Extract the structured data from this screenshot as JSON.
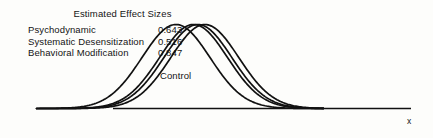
{
  "figure": {
    "background_color": "#fdfdfb",
    "ink_color": "#111111"
  },
  "legend": {
    "title": "Estimated Effect Sizes",
    "rows": [
      {
        "label": "Psychodynamic",
        "value": "0.643"
      },
      {
        "label": "Systematic Desensitization",
        "value": "0.516"
      },
      {
        "label": "Behavioral Modification",
        "value": "0.847"
      }
    ]
  },
  "annotations": {
    "control_label": "Control"
  },
  "axis": {
    "x_label": "x"
  },
  "chart_data": {
    "type": "line",
    "title": "Estimated Effect Sizes",
    "xlabel": "x",
    "ylabel": "",
    "grid": false,
    "legend_position": "top-left",
    "x": [
      -4.0,
      -3.5,
      -3.0,
      -2.5,
      -2.0,
      -1.5,
      -1.0,
      -0.5,
      0.0,
      0.5,
      1.0,
      1.5,
      2.0,
      2.5,
      3.0,
      3.5,
      4.0
    ],
    "xlim": [
      -4.0,
      4.6
    ],
    "ylim": [
      0,
      0.42
    ],
    "series": [
      {
        "name": "Control",
        "effect_size": 0.0,
        "mean": 0.0,
        "sd": 1.0,
        "values": [
          0.0001,
          0.0009,
          0.0044,
          0.0175,
          0.054,
          0.1295,
          0.242,
          0.3521,
          0.3989,
          0.3521,
          0.242,
          0.1295,
          0.054,
          0.0175,
          0.0044,
          0.0009,
          0.0001
        ]
      },
      {
        "name": "Systematic Desensitization",
        "effect_size": 0.516,
        "mean": 0.516,
        "sd": 1.0,
        "values": [
          0.0,
          0.0002,
          0.0012,
          0.0056,
          0.0203,
          0.0573,
          0.1264,
          0.2172,
          0.2907,
          0.3032,
          0.2464,
          0.156,
          0.077,
          0.0296,
          0.0088,
          0.0021,
          0.0004
        ]
      },
      {
        "name": "Psychodynamic",
        "effect_size": 0.643,
        "mean": 0.643,
        "sd": 1.0,
        "values": [
          0.0,
          0.0002,
          0.0008,
          0.0038,
          0.0145,
          0.0432,
          0.1003,
          0.1814,
          0.2556,
          0.2805,
          0.2398,
          0.1597,
          0.0829,
          0.0335,
          0.0105,
          0.0026,
          0.0005
        ]
      },
      {
        "name": "Behavioral Modification",
        "effect_size": 0.847,
        "mean": 0.847,
        "sd": 1.0,
        "values": [
          0.0,
          0.0001,
          0.0004,
          0.0018,
          0.0071,
          0.0229,
          0.058,
          0.1148,
          0.1773,
          0.214,
          0.2021,
          0.149,
          0.0857,
          0.0385,
          0.0135,
          0.0037,
          0.0008
        ]
      }
    ]
  }
}
